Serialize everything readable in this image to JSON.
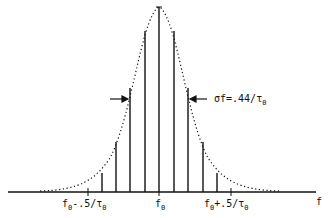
{
  "diagram": {
    "type": "spectrum with gaussian envelope",
    "axis_label": "f",
    "center_label": "f0",
    "left_label": "f0-.5/τ0",
    "right_label": "f0+.5/τ0",
    "annotation": "σf=.44/τ0",
    "colors": {
      "ink": "#111111",
      "background": "#ffffff"
    },
    "lines": [
      {
        "x": 102,
        "top": 173
      },
      {
        "x": 116,
        "top": 142
      },
      {
        "x": 130,
        "top": 88
      },
      {
        "x": 145,
        "top": 31
      },
      {
        "x": 159,
        "top": 7
      },
      {
        "x": 174,
        "top": 31
      },
      {
        "x": 188,
        "top": 88
      },
      {
        "x": 203,
        "top": 142
      },
      {
        "x": 217,
        "top": 173
      }
    ]
  }
}
